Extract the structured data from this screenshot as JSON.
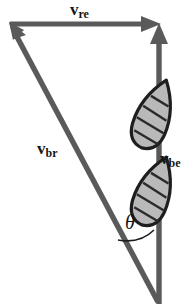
{
  "figure": {
    "background_color": "#ffffff",
    "width": 196,
    "height": 305
  },
  "colors": {
    "arrow_gray": "#5a5a5a",
    "arrow_gray_dark": "#4a4a4a",
    "boat_outline": "#1e1e1e",
    "boat_fill": "#b9b9b9",
    "boat_thwart": "#2a2a2a",
    "label_text": "#151515",
    "arc_stroke": "#1e1e1e"
  },
  "labels": {
    "v_re": {
      "base": "v",
      "sub": "re",
      "name": "velocity-river-earth"
    },
    "v_br": {
      "base": "v",
      "sub": "br",
      "name": "velocity-boat-river"
    },
    "v_be": {
      "base": "v",
      "sub": "be",
      "name": "velocity-boat-earth"
    },
    "theta": {
      "symbol": "θ",
      "name": "angle-theta"
    }
  },
  "vectors": [
    {
      "name": "v-re",
      "label": "v_re",
      "direction": "right",
      "from": [
        10,
        24
      ],
      "to": [
        160,
        24
      ],
      "description": "horizontal river current vector pointing right along the top"
    },
    {
      "name": "v-be",
      "label": "v_be",
      "direction": "up",
      "from": [
        159,
        303
      ],
      "to": [
        159,
        24
      ],
      "description": "vertical resultant boat-relative-to-earth vector pointing up"
    },
    {
      "name": "v-br",
      "label": "v_br",
      "direction": "up-left",
      "from": [
        158,
        302
      ],
      "to": [
        10,
        24
      ],
      "description": "diagonal boat-relative-to-river heading vector pointing up and left"
    }
  ],
  "boats": [
    {
      "name": "boat-upper",
      "cx": 154,
      "cy": 114,
      "rotation_deg": 20
    },
    {
      "name": "boat-lower",
      "cx": 154,
      "cy": 191,
      "rotation_deg": 20
    }
  ],
  "angle_arc": {
    "name": "theta-arc",
    "vertex": [
      158,
      302
    ],
    "between": [
      "v-br",
      "v-be"
    ],
    "symbol": "θ"
  }
}
